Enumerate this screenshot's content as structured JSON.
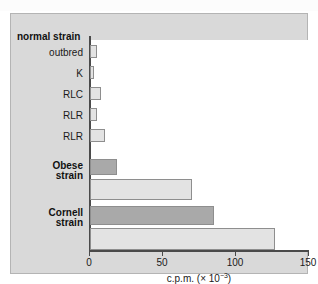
{
  "figure": {
    "background_color": "#d9d9d9",
    "plot_background_color": "#ffffff",
    "bar_light_color": "#e3e3e3",
    "bar_dark_color": "#a9a9a9",
    "axis_color": "#4a4a4a"
  },
  "group_heading": "normal strain",
  "axis": {
    "x_title_prefix": "c.p.m. (",
    "x_title_times": "× 10",
    "x_title_exponent": "−3",
    "x_title_suffix": ")",
    "tick_labels": [
      "0",
      "50",
      "100",
      "150"
    ]
  },
  "chart_data": {
    "type": "bar",
    "orientation": "horizontal",
    "title": "",
    "xlabel": "c.p.m. (× 10⁻³)",
    "ylabel": "",
    "xlim": [
      0,
      150
    ],
    "xticks": [
      0,
      50,
      100,
      150
    ],
    "grid": false,
    "legend": "none",
    "categories": [
      "outbred",
      "K",
      "RLC",
      "RLR",
      "RLR",
      "Obese strain",
      "Obese strain",
      "Cornell strain",
      "Cornell strain"
    ],
    "values": [
      4.5,
      2.5,
      7.5,
      4.5,
      10,
      18.5,
      70,
      85,
      127
    ],
    "bar_shades": [
      "light",
      "light",
      "light",
      "light",
      "light",
      "dark",
      "light",
      "dark",
      "light"
    ],
    "groups": [
      {
        "label": "normal strain",
        "bold": true,
        "bars": [
          {
            "label": "outbred",
            "value": 4.5,
            "shade": "light"
          },
          {
            "label": "K",
            "value": 2.5,
            "shade": "light"
          },
          {
            "label": "RLC",
            "value": 7.5,
            "shade": "light"
          },
          {
            "label": "RLR",
            "value": 4.5,
            "shade": "light"
          },
          {
            "label": "RLR",
            "value": 10,
            "shade": "light"
          }
        ]
      },
      {
        "label": "Obese strain",
        "bold": true,
        "bars": [
          {
            "label": "",
            "value": 18.5,
            "shade": "dark"
          },
          {
            "label": "",
            "value": 70,
            "shade": "light"
          }
        ]
      },
      {
        "label": "Cornell strain",
        "bold": true,
        "bars": [
          {
            "label": "",
            "value": 85,
            "shade": "dark"
          },
          {
            "label": "",
            "value": 127,
            "shade": "light"
          }
        ]
      }
    ]
  },
  "row_labels": [
    {
      "line1": "outbred",
      "line2": "",
      "bold": false
    },
    {
      "line1": "K",
      "line2": "",
      "bold": false
    },
    {
      "line1": "RLC",
      "line2": "",
      "bold": false
    },
    {
      "line1": "RLR",
      "line2": "",
      "bold": false
    },
    {
      "line1": "RLR",
      "line2": "",
      "bold": false
    },
    {
      "line1": "Obese",
      "line2": "strain",
      "bold": true
    },
    {
      "line1": "Cornell",
      "line2": "strain",
      "bold": true
    }
  ]
}
